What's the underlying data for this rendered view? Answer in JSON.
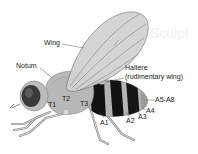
{
  "figure": {
    "background_text": "Sculpt",
    "labels": {
      "wing": "Wing",
      "notum": "Notum",
      "haltere_line1": "Haltere",
      "haltere_line2": "(rudimentary wing)",
      "t1": "T1",
      "t2": "T2",
      "t3": "T3",
      "a1": "A1",
      "a2": "A2",
      "a3": "A3",
      "a4": "A4",
      "a5_a8": "A5-A8"
    },
    "colors": {
      "body_gray": "#b4b4b4",
      "wing_gray": "#d2d2d2",
      "stripe_black": "#111111",
      "eye_dark": "#3a3a3a",
      "label_text": "#222222"
    }
  }
}
